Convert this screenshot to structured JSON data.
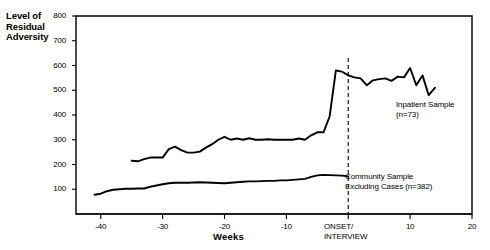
{
  "chart_data": {
    "type": "line",
    "title": "",
    "xlabel": "Weeks",
    "ylabel": "Level of\nResidual\nAdversity",
    "xlim": [
      -44,
      20
    ],
    "ylim": [
      0,
      800
    ],
    "grid": false,
    "legend_position": "inline-annotations",
    "yticks": [
      100,
      200,
      300,
      400,
      500,
      600,
      700,
      800
    ],
    "ytick_labels": [
      "100",
      "200",
      "300",
      "400",
      "500",
      "600",
      "700",
      "800"
    ],
    "xticks": [
      -40,
      -30,
      -20,
      -10,
      0,
      10,
      20
    ],
    "xtick_labels": [
      "-40",
      "-30",
      "-20",
      "-10",
      "ONSET/\nINTERVIEW",
      "10",
      "20"
    ],
    "annotations": [
      {
        "name": "onset-marker",
        "text": "ONSET/\nINTERVIEW",
        "x": 0,
        "style": "vertical-dashed-line"
      },
      {
        "name": "inpatient-series-label",
        "text": "Inpatient Sample\n(n=73)",
        "x": 9,
        "y": 470
      },
      {
        "name": "community-series-label",
        "text": "Community Sample\nExcluding Cases  (n=382)",
        "x": 1,
        "y": 175
      }
    ],
    "series": [
      {
        "name": "Inpatient Sample",
        "label": "Inpatient Sample",
        "n": 73,
        "color": "#000000",
        "x": [
          -35,
          -34,
          -33,
          -32,
          -31,
          -30,
          -29,
          -28,
          -27,
          -26,
          -25,
          -24,
          -23,
          -22,
          -21,
          -20,
          -19,
          -18,
          -17,
          -16,
          -15,
          -14,
          -13,
          -12,
          -11,
          -10,
          -9,
          -8,
          -7,
          -6,
          -5,
          -4,
          -3,
          -2,
          -1,
          0,
          1,
          2,
          3,
          4,
          5,
          6,
          7,
          8,
          9,
          10,
          11,
          12,
          13,
          14
        ],
        "y": [
          215,
          213,
          222,
          228,
          228,
          228,
          262,
          272,
          258,
          248,
          248,
          252,
          268,
          282,
          300,
          312,
          300,
          305,
          300,
          306,
          300,
          300,
          302,
          300,
          300,
          300,
          300,
          305,
          300,
          318,
          330,
          330,
          395,
          580,
          575,
          560,
          552,
          548,
          520,
          540,
          545,
          548,
          538,
          555,
          552,
          590,
          520,
          560,
          480,
          510
        ]
      },
      {
        "name": "Community Sample Excluding Cases",
        "label": "Community Sample\nExcluding Cases",
        "n": 382,
        "color": "#000000",
        "x": [
          -41,
          -40,
          -39,
          -38,
          -37,
          -36,
          -35,
          -34,
          -33,
          -32,
          -31,
          -30,
          -29,
          -28,
          -27,
          -26,
          -25,
          -24,
          -23,
          -22,
          -21,
          -20,
          -19,
          -18,
          -17,
          -16,
          -15,
          -14,
          -13,
          -12,
          -11,
          -10,
          -9,
          -8,
          -7,
          -6,
          -5,
          -4,
          -3,
          -2,
          -1,
          0
        ],
        "y": [
          78,
          82,
          92,
          98,
          100,
          102,
          102,
          103,
          103,
          110,
          115,
          120,
          124,
          126,
          126,
          126,
          127,
          128,
          127,
          126,
          125,
          124,
          126,
          128,
          130,
          132,
          132,
          133,
          134,
          134,
          136,
          136,
          138,
          140,
          142,
          150,
          156,
          158,
          157,
          156,
          155,
          152
        ]
      }
    ]
  }
}
